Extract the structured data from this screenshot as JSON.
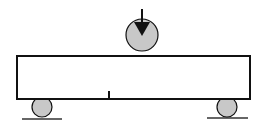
{
  "diagram": {
    "canvas": {
      "width": 265,
      "height": 127,
      "background": "#ffffff"
    },
    "colors": {
      "stroke": "#111111",
      "roller_fill": "#c8c8c8",
      "ground": "#333333"
    },
    "beam": {
      "x": 17,
      "y": 56,
      "width": 233,
      "height": 43,
      "stroke_width": 2
    },
    "load_roller": {
      "cx": 142,
      "cy": 35,
      "r": 16
    },
    "load_arrow": {
      "x": 142,
      "shaft_top": 9,
      "shaft_bottom": 22,
      "head_half_width": 8,
      "head_tip": 36
    },
    "supports": [
      {
        "name": "left",
        "cx": 42,
        "cy": 107,
        "r": 10,
        "ground": {
          "x1": 22,
          "x2": 62,
          "y": 119
        }
      },
      {
        "name": "right",
        "cx": 227,
        "cy": 107,
        "r": 10,
        "ground": {
          "x1": 207,
          "x2": 248,
          "y": 118
        }
      }
    ],
    "notch": {
      "x": 109,
      "y_top": 91,
      "y_bottom": 98,
      "width": 2
    }
  }
}
